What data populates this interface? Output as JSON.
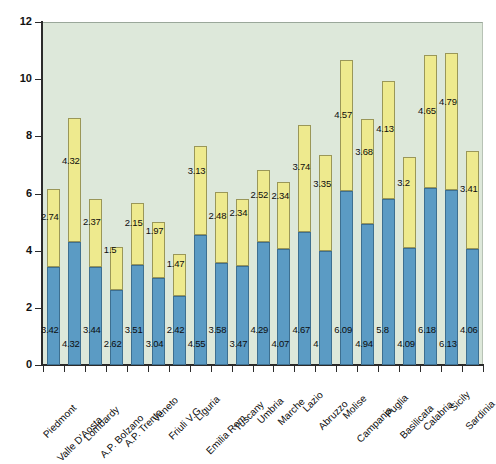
{
  "chart_data": {
    "type": "bar",
    "stacked": true,
    "title": "",
    "subtitle": "",
    "xlabel": "",
    "ylabel": "",
    "ylim": [
      0,
      12
    ],
    "yticks": [
      0,
      2,
      4,
      6,
      8,
      10,
      12
    ],
    "grid": false,
    "legend": "none",
    "plot_background": "#dde8da",
    "categories": [
      "Piedmont",
      "Valle D'Aosta",
      "Lombardy",
      "A.P. Bolzano",
      "A.P. Trento",
      "Veneto",
      "Friuli V.G.",
      "Liguria",
      "Emilia Rom.",
      "Tuscany",
      "Umbria",
      "Marche",
      "Lazio",
      "Abruzzo",
      "Molise",
      "Campania",
      "Puglia",
      "Basilicata",
      "Calabria",
      "Sicily",
      "Sardinia"
    ],
    "series": [
      {
        "name": "lower",
        "color": "#5b9bc4",
        "values": [
          3.42,
          4.32,
          3.44,
          2.62,
          3.51,
          3.04,
          2.42,
          4.55,
          3.58,
          3.47,
          4.29,
          4.07,
          4.67,
          4,
          6.09,
          4.94,
          5.8,
          4.09,
          6.18,
          6.13,
          4.06
        ]
      },
      {
        "name": "upper",
        "color": "#eeea8e",
        "values": [
          2.74,
          4.32,
          2.37,
          1.5,
          2.15,
          1.97,
          1.47,
          3.13,
          2.48,
          2.34,
          2.52,
          2.34,
          3.74,
          3.35,
          4.57,
          3.68,
          4.13,
          3.2,
          4.65,
          4.79,
          3.41
        ]
      }
    ],
    "value_labels_lower": [
      "3.42",
      "4.32",
      "3.44",
      "2.62",
      "3.51",
      "3.04",
      "2.42",
      "4.55",
      "3.58",
      "3.47",
      "4.29",
      "4.07",
      "4.67",
      "4",
      "6.09",
      "4.94",
      "5.8",
      "4.09",
      "6.18",
      "6.13",
      "4.06"
    ],
    "value_labels_upper": [
      "2.74",
      "4.32",
      "2.37",
      "1.5",
      "2.15",
      "1.97",
      "1.47",
      "3.13",
      "2.48",
      "2.34",
      "2.52",
      "2.34",
      "3.74",
      "3.35",
      "4.57",
      "3.68",
      "4.13",
      "3.2",
      "4.65",
      "4.79",
      "3.41"
    ]
  }
}
